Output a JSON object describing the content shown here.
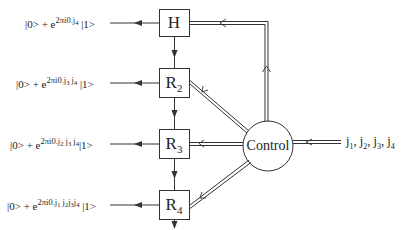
{
  "diagram": {
    "type": "quantum-fourier-transform-circuit",
    "gates": [
      {
        "id": "H",
        "label": "H",
        "sub": ""
      },
      {
        "id": "R2",
        "label": "R",
        "sub": "2"
      },
      {
        "id": "R3",
        "label": "R",
        "sub": "3"
      },
      {
        "id": "R4",
        "label": "R",
        "sub": "4"
      }
    ],
    "outputs": [
      {
        "prefix": "|0> + e",
        "exp": "2πi0.",
        "bits": [
          "j4"
        ],
        "bits_text": [
          {
            "j": "j",
            "n": "4"
          }
        ],
        "suffix": "|1>"
      },
      {
        "prefix": "|0> + e",
        "exp": "2πi0.",
        "bits_text": [
          {
            "j": "j",
            "n": "3"
          },
          {
            "j": "j",
            "n": "4"
          }
        ],
        "suffix": "|1>"
      },
      {
        "prefix": "|0> + e",
        "exp": "2πi0.",
        "bits_text": [
          {
            "j": "j",
            "n": "2"
          },
          {
            "j": "j",
            "n": "3"
          },
          {
            "j": "j",
            "n": "4"
          }
        ],
        "suffix": "|1>"
      },
      {
        "prefix": "|0> + e",
        "exp": "2πi0.",
        "bits_text": [
          {
            "j": "j",
            "n": "1"
          },
          {
            "j": "j",
            "n": "2"
          },
          {
            "j": "j",
            "n": "3"
          },
          {
            "j": "j",
            "n": "4"
          }
        ],
        "suffix": "|1>"
      }
    ],
    "control": {
      "label": "Control"
    },
    "input": {
      "items": [
        {
          "j": "j",
          "n": "1"
        },
        {
          "j": "j",
          "n": "2"
        },
        {
          "j": "j",
          "n": "3"
        },
        {
          "j": "j",
          "n": "4"
        }
      ],
      "separator": ", "
    },
    "colors": {
      "line": "#333333",
      "background": "#ffffff"
    }
  }
}
